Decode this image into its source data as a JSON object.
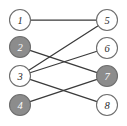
{
  "figure": {
    "type": "bipartite-graph",
    "width": 127,
    "height": 126,
    "background_color": "#ffffff"
  },
  "style": {
    "edge_color": "#3a3a3a",
    "node_stroke_color": "#6e6e6e",
    "node_fill_white": "#ffffff",
    "node_fill_gray": "#8c8c8c",
    "label_color_dark": "#2b2b2b",
    "label_color_light": "#ffffff",
    "node_radius": 10.5
  },
  "graph_data": {
    "type": "graph",
    "layout": "bipartite-two-column",
    "nodes": [
      {
        "id": "1",
        "label": "1",
        "x": 20,
        "y": 20,
        "column": "left",
        "fill": "white",
        "shaded": false
      },
      {
        "id": "2",
        "label": "2",
        "x": 20,
        "y": 47,
        "column": "left",
        "fill": "gray",
        "shaded": true
      },
      {
        "id": "3",
        "label": "3",
        "x": 20,
        "y": 76,
        "column": "left",
        "fill": "white",
        "shaded": false
      },
      {
        "id": "4",
        "label": "4",
        "x": 20,
        "y": 105,
        "column": "left",
        "fill": "gray",
        "shaded": true
      },
      {
        "id": "5",
        "label": "5",
        "x": 107,
        "y": 20,
        "column": "right",
        "fill": "white",
        "shaded": false
      },
      {
        "id": "6",
        "label": "6",
        "x": 107,
        "y": 48,
        "column": "right",
        "fill": "white",
        "shaded": false
      },
      {
        "id": "7",
        "label": "7",
        "x": 107,
        "y": 76,
        "column": "right",
        "fill": "gray",
        "shaded": true
      },
      {
        "id": "8",
        "label": "8",
        "x": 107,
        "y": 105,
        "column": "right",
        "fill": "white",
        "shaded": false
      }
    ],
    "edges": [
      {
        "source": "1",
        "target": "5"
      },
      {
        "source": "3",
        "target": "5"
      },
      {
        "source": "3",
        "target": "6"
      },
      {
        "source": "2",
        "target": "7"
      },
      {
        "source": "4",
        "target": "7"
      },
      {
        "source": "3",
        "target": "8"
      }
    ]
  }
}
